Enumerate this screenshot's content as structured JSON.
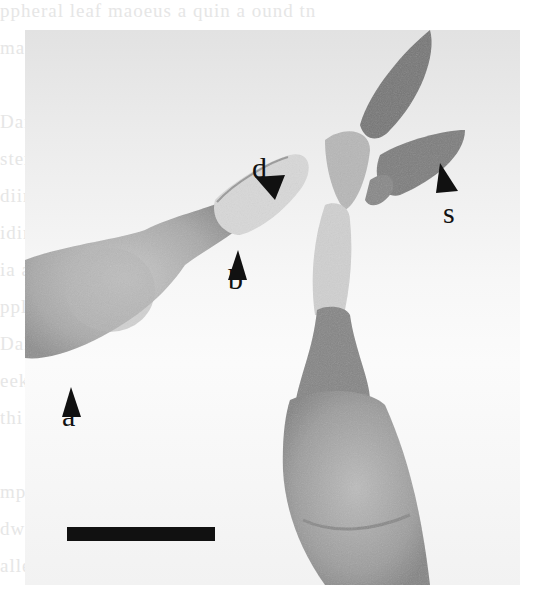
{
  "figure": {
    "type": "grayscale micrograph",
    "labels": [
      {
        "id": "d",
        "text": "d",
        "x": 252,
        "y": 153
      },
      {
        "id": "s",
        "text": "s",
        "x": 445,
        "y": 196
      },
      {
        "id": "b",
        "text": "b",
        "x": 229,
        "y": 262
      },
      {
        "id": "a",
        "text": "a",
        "x": 62,
        "y": 400
      }
    ],
    "scale_bar": {
      "x": 67,
      "y": 527,
      "width": 148,
      "height": 14,
      "color": "#111111"
    }
  },
  "bleed_through_lines": [
    "  ppheral    leaf  maoeus  a  quin  a  ound  tn",
    "  ma                                        o",
    "",
    "     Dann                    ts     eoyrrh",
    "     stem                  fim  or        ul",
    "     diim  ge'              ss              m",
    "     idingb                                  ",
    "     ia  as  Ot                              ",
    "     ppl    co    y                           ",
    "     Dal    T                 o  yae  tuey",
    "     eeks                      h    toeeoi",
    "     thi    rs                               ",
    "",
    "     mpos                                    ",
    "     dw sho                                  ",
    "     alleMa                                  "
  ]
}
